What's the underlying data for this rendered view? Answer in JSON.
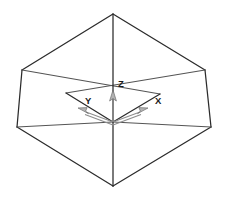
{
  "figure": {
    "background_color": "#ffffff",
    "edge_color": "#2b2b2b",
    "axis_color": "#8d8d8d",
    "axis_head_fill": "#b3b3b3",
    "label_color": "#1a1a1a"
  },
  "axes": {
    "origin_label": "",
    "x": {
      "label": "X",
      "label_x": 155,
      "label_y": 104,
      "direction": "down-right"
    },
    "y": {
      "label": "Y",
      "label_x": 85,
      "label_y": 104,
      "direction": "down-left"
    },
    "z": {
      "label": "Z",
      "label_x": 118,
      "label_y": 87,
      "direction": "up"
    }
  },
  "geometry": {
    "type": "truncated-pyramid-open-box",
    "top_rim": {
      "name": "top-rim-diamond",
      "points": "113,14 22,70 17,127 113,186 211,127 205,70"
    },
    "rim_back_left": "22,70 113,122",
    "rim_back_right": "205,70 113,122",
    "rim_front_left": "17,127 113,122",
    "rim_front_right": "211,127 113,122",
    "inner_base": {
      "name": "inner-base-diamond",
      "points": "113,65 160,94 113,122 66,93"
    },
    "vertical_left": "22,70 17,127",
    "vertical_right": "205,70 211,127",
    "center_post": "113,14 113,186",
    "origin": {
      "x": 113,
      "y": 122
    }
  }
}
